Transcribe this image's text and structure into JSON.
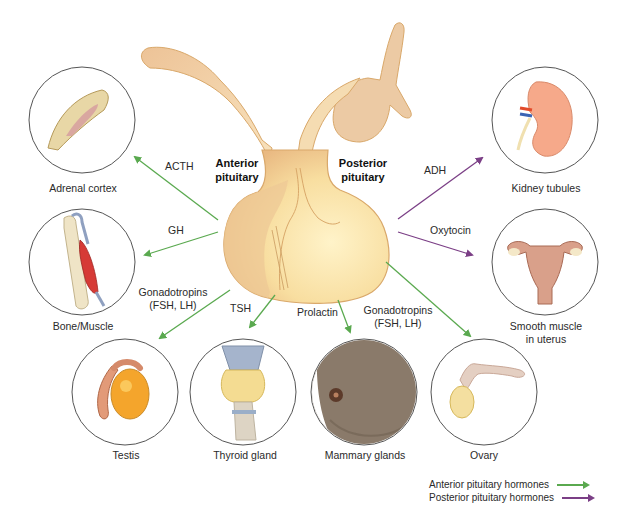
{
  "figure": {
    "center": {
      "anterior_label": [
        "Anterior",
        "pituitary"
      ],
      "posterior_label": [
        "Posterior",
        "pituitary"
      ]
    },
    "targets": [
      {
        "id": "adrenal",
        "label": "Adrenal cortex",
        "hormone": "ACTH",
        "source": "anterior"
      },
      {
        "id": "bone",
        "label": "Bone/Muscle",
        "hormone": "GH",
        "source": "anterior"
      },
      {
        "id": "testis",
        "label": "Testis",
        "hormone": "Gonadotropins\n(FSH, LH)",
        "hormone_lines": [
          "Gonadotropins",
          "(FSH, LH)"
        ],
        "source": "anterior"
      },
      {
        "id": "thyroid",
        "label": "Thyroid gland",
        "hormone": "TSH",
        "source": "anterior"
      },
      {
        "id": "mammary",
        "label": "Mammary glands",
        "hormone": "Prolactin",
        "source": "anterior"
      },
      {
        "id": "ovary",
        "label": "Ovary",
        "hormone": "Gonadotropins\n(FSH, LH)",
        "hormone_lines": [
          "Gonadotropins",
          "(FSH, LH)"
        ],
        "source": "anterior"
      },
      {
        "id": "kidney",
        "label": "Kidney tubules",
        "hormone": "ADH",
        "source": "posterior"
      },
      {
        "id": "uterus",
        "label": "Smooth muscle in uterus",
        "label_lines": [
          "Smooth muscle",
          "in uterus"
        ],
        "hormone": "Oxytocin",
        "source": "posterior"
      }
    ],
    "legend": [
      {
        "label": "Anterior pituitary hormones",
        "color": "#5aa94f"
      },
      {
        "label": "Posterior pituitary hormones",
        "color": "#7b3f86"
      }
    ],
    "colors": {
      "anterior_arrow": "#5aa94f",
      "posterior_arrow": "#7b3f86",
      "gland_fill": "#f7dca3",
      "gland_stroke": "#d9a86a",
      "circle_stroke": "#555555"
    }
  }
}
